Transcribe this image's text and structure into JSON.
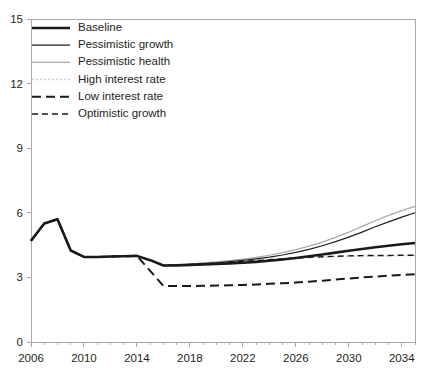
{
  "chart_data": {
    "type": "line",
    "title": "",
    "subtitle": "",
    "xlabel": "",
    "ylabel": "",
    "xlim": [
      2006,
      2035
    ],
    "ylim": [
      0,
      15
    ],
    "yticks": [
      0,
      3,
      6,
      9,
      12,
      15
    ],
    "xticks": [
      2006,
      2010,
      2014,
      2018,
      2022,
      2026,
      2030,
      2034
    ],
    "xtick_labels": [
      "2006",
      "2010",
      "2014",
      "2018",
      "2022",
      "2026",
      "2030",
      "2034"
    ],
    "ytick_labels": [
      "0",
      "3",
      "6",
      "9",
      "12",
      "15"
    ],
    "xminor_tick_step": 1,
    "grid": false,
    "legend_position": "top-left",
    "x": [
      2006,
      2007,
      2008,
      2009,
      2010,
      2011,
      2012,
      2013,
      2014,
      2015,
      2016,
      2017,
      2018,
      2019,
      2020,
      2021,
      2022,
      2023,
      2024,
      2025,
      2026,
      2027,
      2028,
      2029,
      2030,
      2031,
      2032,
      2033,
      2034,
      2035
    ],
    "series": [
      {
        "name": "Baseline",
        "style": "solid-thick",
        "color": "#1a1a1a",
        "width": 2.6,
        "values": [
          4.7,
          5.5,
          5.7,
          4.25,
          3.95,
          3.95,
          3.97,
          3.98,
          4.0,
          3.8,
          3.55,
          3.56,
          3.58,
          3.6,
          3.62,
          3.65,
          3.68,
          3.72,
          3.77,
          3.83,
          3.9,
          3.98,
          4.06,
          4.15,
          4.24,
          4.32,
          4.4,
          4.47,
          4.54,
          4.6
        ]
      },
      {
        "name": "Pessimistic growth",
        "style": "solid-thin",
        "color": "#231f20",
        "width": 1.2,
        "values": [
          4.7,
          5.5,
          5.7,
          4.25,
          3.95,
          3.95,
          3.97,
          3.98,
          4.0,
          3.8,
          3.55,
          3.57,
          3.6,
          3.64,
          3.68,
          3.73,
          3.79,
          3.86,
          3.94,
          4.04,
          4.16,
          4.3,
          4.47,
          4.66,
          4.87,
          5.1,
          5.35,
          5.58,
          5.8,
          6.0
        ]
      },
      {
        "name": "Pessimistic health",
        "style": "solid-thin-gray",
        "color": "#a7a9ac",
        "width": 1.2,
        "values": [
          4.7,
          5.5,
          5.7,
          4.25,
          3.95,
          3.95,
          3.97,
          3.98,
          4.0,
          3.8,
          3.55,
          3.58,
          3.62,
          3.67,
          3.72,
          3.78,
          3.85,
          3.93,
          4.03,
          4.15,
          4.29,
          4.45,
          4.64,
          4.86,
          5.1,
          5.37,
          5.63,
          5.88,
          6.1,
          6.3
        ]
      },
      {
        "name": "High interest rate",
        "style": "dotted-light",
        "color": "#c9cbcd",
        "width": 1.5,
        "values": [
          4.7,
          5.5,
          5.7,
          4.25,
          3.95,
          3.95,
          3.97,
          3.98,
          4.0,
          3.8,
          3.55,
          3.58,
          3.62,
          3.66,
          3.7,
          3.74,
          3.78,
          3.81,
          3.84,
          3.87,
          3.9,
          3.92,
          3.94,
          3.96,
          3.97,
          3.98,
          3.99,
          4.0,
          4.0,
          4.0
        ]
      },
      {
        "name": "Low interest rate",
        "style": "dashed-long",
        "color": "#1a1a1a",
        "width": 2.0,
        "values": [
          4.7,
          5.5,
          5.7,
          4.25,
          3.95,
          3.95,
          3.97,
          3.98,
          4.0,
          3.3,
          2.6,
          2.6,
          2.6,
          2.61,
          2.62,
          2.63,
          2.65,
          2.67,
          2.7,
          2.73,
          2.76,
          2.8,
          2.85,
          2.9,
          2.95,
          3.0,
          3.04,
          3.08,
          3.12,
          3.15
        ]
      },
      {
        "name": "Optimistic growth",
        "style": "dashed-medium",
        "color": "#1a1a1a",
        "width": 1.4,
        "values": [
          4.7,
          5.5,
          5.7,
          4.25,
          3.95,
          3.95,
          3.97,
          3.98,
          4.0,
          3.8,
          3.55,
          3.57,
          3.6,
          3.63,
          3.66,
          3.7,
          3.74,
          3.78,
          3.82,
          3.86,
          3.9,
          3.93,
          3.96,
          3.98,
          4.0,
          4.01,
          4.02,
          4.02,
          4.03,
          4.03
        ]
      }
    ],
    "legend": [
      {
        "label": "Baseline",
        "style": "solid-thick",
        "color": "#1a1a1a"
      },
      {
        "label": "Pessimistic growth",
        "style": "solid-thin",
        "color": "#231f20"
      },
      {
        "label": "Pessimistic health",
        "style": "solid-thin-gray",
        "color": "#a7a9ac"
      },
      {
        "label": "High interest rate",
        "style": "dotted-light",
        "color": "#c9cbcd"
      },
      {
        "label": "Low interest rate",
        "style": "dashed-long",
        "color": "#1a1a1a"
      },
      {
        "label": "Optimistic growth",
        "style": "dashed-medium",
        "color": "#1a1a1a"
      }
    ]
  }
}
